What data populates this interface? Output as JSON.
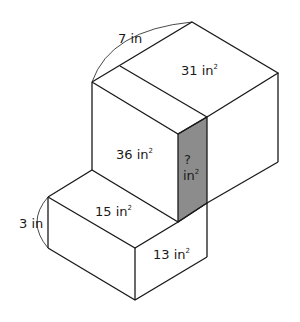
{
  "diagram": {
    "type": "composite rectangular prisms",
    "labels": {
      "top_edge_length": "7 in",
      "top_face_area": "31 in",
      "front_face_area": "36 in",
      "unknown_face_q": "?",
      "unknown_face_unit": "in",
      "small_top_area": "15 in",
      "small_front_area": "13 in",
      "height_length": "3 in",
      "squared": "2"
    },
    "colors": {
      "shaded_face": "#8c8c8c",
      "stroke": "#1a1a1a",
      "background": "#ffffff"
    }
  }
}
